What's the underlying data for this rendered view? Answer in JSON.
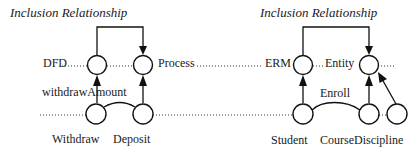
{
  "left_panel": {
    "title": "Inclusion Relationship",
    "top_nodes": [
      {
        "label": "DFD"
      },
      {
        "label": "Process"
      }
    ],
    "edge_label": "withdrawAmount",
    "bottom_nodes": [
      {
        "label": "Withdraw"
      },
      {
        "label": "Deposit"
      }
    ]
  },
  "right_panel": {
    "title": "Inclusion Relationship",
    "top_nodes": [
      {
        "label": "ERM"
      },
      {
        "label": "Entity"
      }
    ],
    "edge_label": "Enroll",
    "bottom_nodes": [
      {
        "label": "Student"
      },
      {
        "label": "Course"
      },
      {
        "label": "Discipline"
      }
    ]
  },
  "colors": {
    "background": "#ffffff",
    "ink": "#111111"
  }
}
